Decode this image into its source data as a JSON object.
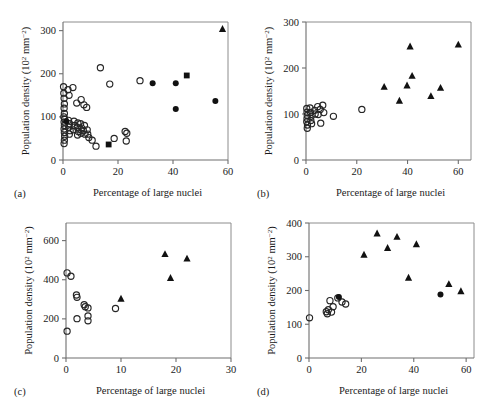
{
  "figure": {
    "axis_title_x": "Percentage of large nuclei",
    "axis_title_y_prefix": "Population density (10",
    "axis_title_y_exp": "2",
    "axis_title_y_mid": " mm",
    "axis_title_y_exp2": "−2",
    "axis_title_y_suffix": ")",
    "panel_tags": [
      "(a)",
      "(b)",
      "(c)",
      "(d)"
    ]
  },
  "chart_data": [
    {
      "panel": "(a)",
      "type": "scatter",
      "title": "",
      "xlabel": "Percentage of large nuclei",
      "ylabel": "Population density (10^2 mm^-2)",
      "xlim": [
        0,
        60
      ],
      "ylim": [
        0,
        320
      ],
      "xticks": [
        0,
        20,
        40,
        60
      ],
      "yticks": [
        0,
        100,
        200,
        300
      ],
      "xticklabels": [
        "0",
        "20",
        "40",
        "60"
      ],
      "yticklabels": [
        "0",
        "100",
        "200",
        "300"
      ],
      "grid": false,
      "legend": "none",
      "series": [
        {
          "name": "open-circle",
          "marker": "open-circle",
          "points": [
            [
              0.2,
              170
            ],
            [
              0.3,
              155
            ],
            [
              0.4,
              143
            ],
            [
              0.5,
              130
            ],
            [
              0.4,
              120
            ],
            [
              0.5,
              108
            ],
            [
              0.3,
              100
            ],
            [
              0.6,
              95
            ],
            [
              0.4,
              88
            ],
            [
              0.5,
              80
            ],
            [
              0.4,
              72
            ],
            [
              0.5,
              64
            ],
            [
              0.6,
              55
            ],
            [
              0.5,
              46
            ],
            [
              0.4,
              38
            ],
            [
              1.8,
              163
            ],
            [
              2.2,
              150
            ],
            [
              2.0,
              92
            ],
            [
              2.4,
              84
            ],
            [
              2.1,
              76
            ],
            [
              2.6,
              68
            ],
            [
              2.3,
              60
            ],
            [
              3.6,
              168
            ],
            [
              4.0,
              90
            ],
            [
              4.2,
              80
            ],
            [
              3.8,
              70
            ],
            [
              5.0,
              132
            ],
            [
              5.4,
              86
            ],
            [
              5.2,
              76
            ],
            [
              5.6,
              66
            ],
            [
              5.3,
              58
            ],
            [
              6.6,
              140
            ],
            [
              6.4,
              84
            ],
            [
              6.8,
              74
            ],
            [
              6.5,
              62
            ],
            [
              7.6,
              128
            ],
            [
              7.8,
              80
            ],
            [
              7.4,
              68
            ],
            [
              8.0,
              60
            ],
            [
              8.6,
              122
            ],
            [
              8.8,
              70
            ],
            [
              9.0,
              60
            ],
            [
              9.4,
              52
            ],
            [
              10.6,
              46
            ],
            [
              12.0,
              32
            ],
            [
              13.6,
              214
            ],
            [
              17.0,
              176
            ],
            [
              18.6,
              50
            ],
            [
              22.6,
              66
            ],
            [
              23.2,
              62
            ],
            [
              23.0,
              44
            ],
            [
              28.0,
              184
            ]
          ]
        },
        {
          "name": "filled-circle",
          "marker": "filled-circle",
          "points": [
            [
              1.2,
              90
            ],
            [
              32.6,
              178
            ],
            [
              41.0,
              178
            ],
            [
              41.0,
              118
            ],
            [
              55.4,
              137
            ]
          ]
        },
        {
          "name": "filled-square",
          "marker": "filled-square",
          "points": [
            [
              16.6,
              36
            ],
            [
              45.0,
              196
            ]
          ]
        },
        {
          "name": "filled-triangle",
          "marker": "filled-triangle",
          "points": [
            [
              58.0,
              304
            ]
          ]
        }
      ]
    },
    {
      "panel": "(b)",
      "type": "scatter",
      "title": "",
      "xlabel": "Percentage of large nuclei",
      "ylabel": "Population density (10^2 mm^-2)",
      "xlim": [
        0,
        65
      ],
      "ylim": [
        0,
        300
      ],
      "xticks": [
        0,
        20,
        40,
        60
      ],
      "yticks": [
        0,
        100,
        200,
        300
      ],
      "xticklabels": [
        "0",
        "20",
        "40",
        "60"
      ],
      "yticklabels": [
        "0",
        "100",
        "200",
        "300"
      ],
      "grid": false,
      "legend": "none",
      "series": [
        {
          "name": "open-circle",
          "marker": "open-circle",
          "points": [
            [
              0.3,
              112
            ],
            [
              0.4,
              104
            ],
            [
              0.5,
              97
            ],
            [
              0.4,
              90
            ],
            [
              0.3,
              83
            ],
            [
              0.6,
              76
            ],
            [
              0.5,
              69
            ],
            [
              1.6,
              113
            ],
            [
              1.8,
              103
            ],
            [
              2.0,
              95
            ],
            [
              1.9,
              86
            ],
            [
              2.2,
              79
            ],
            [
              3.4,
              108
            ],
            [
              3.6,
              100
            ],
            [
              4.6,
              116
            ],
            [
              4.8,
              99
            ],
            [
              5.6,
              110
            ],
            [
              5.8,
              80
            ],
            [
              6.6,
              119
            ],
            [
              7.0,
              103
            ],
            [
              10.8,
              95
            ],
            [
              22.0,
              110
            ]
          ]
        },
        {
          "name": "filled-triangle",
          "marker": "filled-triangle",
          "points": [
            [
              30.8,
              159
            ],
            [
              36.8,
              129
            ],
            [
              39.8,
              162
            ],
            [
              41.0,
              247
            ],
            [
              41.8,
              183
            ],
            [
              49.2,
              139
            ],
            [
              53.0,
              157
            ],
            [
              60.0,
              251
            ]
          ]
        }
      ]
    },
    {
      "panel": "(c)",
      "type": "scatter",
      "title": "",
      "xlabel": "Percentage of large nuclei",
      "ylabel": "Population density (10^2 mm^-2)",
      "xlim": [
        0,
        30
      ],
      "ylim": [
        0,
        690
      ],
      "xticks": [
        0,
        10,
        20,
        30
      ],
      "yticks": [
        0,
        200,
        400,
        600
      ],
      "xticklabels": [
        "0",
        "10",
        "20",
        "30"
      ],
      "yticklabels": [
        "0",
        "200",
        "400",
        "600"
      ],
      "grid": false,
      "legend": "none",
      "series": [
        {
          "name": "open-circle",
          "marker": "open-circle",
          "points": [
            [
              0.2,
              435
            ],
            [
              0.2,
              137
            ],
            [
              0.9,
              418
            ],
            [
              1.9,
              322
            ],
            [
              2.0,
              310
            ],
            [
              2.0,
              201
            ],
            [
              3.3,
              272
            ],
            [
              3.5,
              262
            ],
            [
              4.0,
              256
            ],
            [
              4.0,
              215
            ],
            [
              4.0,
              190
            ],
            [
              9.0,
              253
            ]
          ]
        },
        {
          "name": "filled-triangle",
          "marker": "filled-triangle",
          "points": [
            [
              10.0,
              303
            ],
            [
              18.0,
              531
            ],
            [
              19.0,
              409
            ],
            [
              22.0,
              508
            ]
          ]
        }
      ]
    },
    {
      "panel": "(d)",
      "type": "scatter",
      "title": "",
      "xlabel": "Percentage of large nuclei",
      "ylabel": "Population density (10^2 mm^-2)",
      "xlim": [
        0,
        63
      ],
      "ylim": [
        0,
        400
      ],
      "xticks": [
        0,
        20,
        40,
        60
      ],
      "yticks": [
        0,
        100,
        200,
        300,
        400
      ],
      "xticklabels": [
        "0",
        "20",
        "40",
        "60"
      ],
      "yticklabels": [
        "0",
        "100",
        "200",
        "300",
        "400"
      ],
      "grid": false,
      "legend": "none",
      "series": [
        {
          "name": "open-circle",
          "marker": "open-circle",
          "points": [
            [
              0.2,
              119
            ],
            [
              6.6,
              137
            ],
            [
              7.0,
              131
            ],
            [
              7.4,
              143
            ],
            [
              8.0,
              170
            ],
            [
              8.6,
              136
            ],
            [
              9.2,
              152
            ],
            [
              11.0,
              178
            ],
            [
              12.6,
              166
            ],
            [
              14.0,
              160
            ]
          ]
        },
        {
          "name": "filled-circle",
          "marker": "filled-circle",
          "points": [
            [
              11.4,
              181
            ],
            [
              50.2,
              188
            ]
          ]
        },
        {
          "name": "filled-triangle",
          "marker": "filled-triangle",
          "points": [
            [
              21.0,
              306
            ],
            [
              26.0,
              369
            ],
            [
              30.0,
              326
            ],
            [
              33.6,
              359
            ],
            [
              38.0,
              238
            ],
            [
              41.0,
              337
            ],
            [
              53.4,
              219
            ],
            [
              58.0,
              198
            ]
          ]
        }
      ]
    }
  ]
}
